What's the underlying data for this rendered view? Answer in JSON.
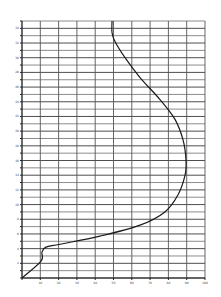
{
  "chart_data": {
    "type": "line",
    "title": "",
    "xlabel": "",
    "ylabel": "",
    "xlim": [
      0,
      100
    ],
    "ylim": [
      0,
      35
    ],
    "grid": true,
    "x_tick_labels": [
      "10",
      "20",
      "30",
      "40",
      "50",
      "60",
      "70",
      "80",
      "90",
      "100"
    ],
    "y_tick_labels": [
      "2",
      "4",
      "6",
      "8",
      "10",
      "12",
      "14",
      "16",
      "18",
      "20",
      "22",
      "24",
      "26",
      "28",
      "30",
      "32",
      "34"
    ],
    "series": [
      {
        "name": "curve",
        "color": "#1a1a1a",
        "x": [
          0,
          10.4,
          10.9,
          13.1,
          20.8,
          42.6,
          64.5,
          78.1,
          85.2,
          89.1,
          89.6,
          88.0,
          83.6,
          75.4,
          64.5,
          56.3,
          50.8,
          49.2,
          49.2
        ],
        "y": [
          0,
          2.3,
          3.5,
          4.2,
          4.6,
          5.7,
          7.2,
          9.0,
          11.3,
          14.0,
          16.1,
          18.8,
          21.6,
          24.3,
          27.3,
          30.0,
          32.2,
          33.4,
          35.0
        ]
      }
    ]
  }
}
